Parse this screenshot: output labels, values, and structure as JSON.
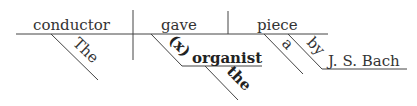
{
  "diagram": {
    "type": "sentence-diagram",
    "subject": "conductor",
    "subject_modifier": "The",
    "verb": "gave",
    "indirect_object_marker": "(x)",
    "indirect_object": "organist",
    "indirect_object_modifier": "the",
    "direct_object": "piece",
    "direct_object_modifier": "a",
    "preposition": "by",
    "prepositional_object": "J. S. Bach",
    "colors": {
      "line": "#444444",
      "text": "#333333",
      "bold_text": "#222222"
    }
  }
}
